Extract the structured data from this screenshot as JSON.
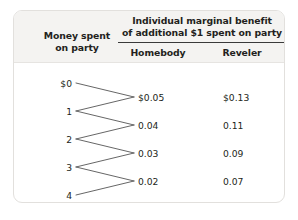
{
  "table": {
    "row_header": {
      "line1": "Money spent",
      "line2": "on party"
    },
    "benefit_header": {
      "line1": "Individual marginal benefit",
      "line2": "of additional $1 spent on party"
    },
    "columns": [
      {
        "key": "homebody",
        "label": "Homebody"
      },
      {
        "key": "reveler",
        "label": "Reveler"
      }
    ],
    "spend_levels": [
      "$0",
      "1",
      "2",
      "3",
      "4"
    ],
    "rows": [
      {
        "from": "$0",
        "to": "1",
        "homebody": "$0.05",
        "reveler": "$0.13"
      },
      {
        "from": "1",
        "to": "2",
        "homebody": "0.04",
        "reveler": "0.11"
      },
      {
        "from": "2",
        "to": "3",
        "homebody": "0.03",
        "reveler": "0.09"
      },
      {
        "from": "3",
        "to": "4",
        "homebody": "0.02",
        "reveler": "0.07"
      }
    ],
    "colors": {
      "header_background": "#f4f3f1",
      "card_background": "#ffffff",
      "border": "#e2e0dd",
      "rule": "#3a3a3a",
      "text": "#231f20",
      "connector_line": "#555555"
    }
  }
}
